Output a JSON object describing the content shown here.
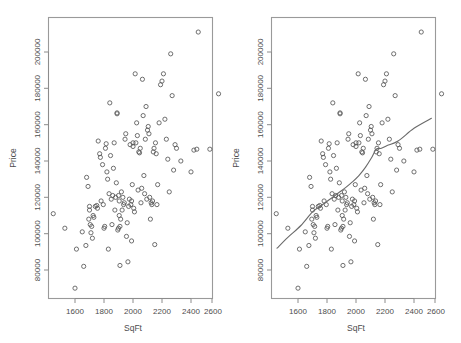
{
  "figure": {
    "title": "",
    "background_color": "#ffffff",
    "panel_count": 2,
    "point_color": "#565656",
    "line_color": "#6a6a6a",
    "frame_color": "#9a9a9a"
  },
  "panels": [
    {
      "name": "scatter-only",
      "has_fit_line": false,
      "xlabel": "SqFt",
      "ylabel": "Price"
    },
    {
      "name": "scatter-with-fit",
      "has_fit_line": true,
      "xlabel": "SqFt",
      "ylabel": "Price"
    }
  ],
  "chart_data": {
    "type": "scatter",
    "title": "",
    "subtitle": "",
    "xlabel": "SqFt",
    "ylabel": "Price",
    "xlim": [
      1440,
      2640
    ],
    "ylim": [
      66000,
      213000
    ],
    "xticks": [
      1600,
      1800,
      2000,
      2200,
      2400,
      2600
    ],
    "xtick_labels": [
      "1600",
      "1800",
      "2000",
      "2200",
      "2400",
      "2600"
    ],
    "yticks": [
      80000,
      100000,
      120000,
      140000,
      160000,
      180000,
      200000
    ],
    "ytick_labels": [
      "80000",
      "100000",
      "120000",
      "140000",
      "160000",
      "180000",
      "200000"
    ],
    "grid": false,
    "legend": null,
    "marker": "open-circle",
    "n_points": 128,
    "x": [
      1450,
      1530,
      1600,
      1610,
      1650,
      1660,
      1675,
      1680,
      1690,
      1695,
      1700,
      1700,
      1705,
      1710,
      1715,
      1720,
      1725,
      1730,
      1740,
      1750,
      1755,
      1760,
      1770,
      1775,
      1780,
      1790,
      1795,
      1800,
      1805,
      1810,
      1815,
      1820,
      1825,
      1830,
      1835,
      1840,
      1845,
      1850,
      1855,
      1860,
      1865,
      1870,
      1875,
      1880,
      1885,
      1890,
      1890,
      1895,
      1900,
      1900,
      1905,
      1905,
      1910,
      1910,
      1915,
      1920,
      1925,
      1930,
      1935,
      1940,
      1945,
      1950,
      1955,
      1960,
      1965,
      1970,
      1975,
      1980,
      1985,
      1990,
      1990,
      1995,
      2000,
      2000,
      2005,
      2010,
      2015,
      2020,
      2025,
      2030,
      2035,
      2040,
      2045,
      2050,
      2055,
      2060,
      2065,
      2070,
      2075,
      2080,
      2085,
      2090,
      2095,
      2100,
      2105,
      2110,
      2115,
      2120,
      2125,
      2130,
      2135,
      2140,
      2145,
      2150,
      2155,
      2160,
      2165,
      2170,
      2180,
      2190,
      2200,
      2210,
      2220,
      2230,
      2240,
      2250,
      2260,
      2270,
      2280,
      2290,
      2300,
      2330,
      2400,
      2420,
      2440,
      2450,
      2530,
      2590
    ],
    "y": [
      111000,
      103000,
      70000,
      91500,
      101000,
      82000,
      93500,
      131000,
      126000,
      108000,
      113000,
      115000,
      105000,
      100500,
      104000,
      97500,
      110000,
      109000,
      115000,
      115500,
      114000,
      151000,
      144000,
      142000,
      118000,
      138000,
      116000,
      103000,
      104000,
      147000,
      149500,
      134000,
      130000,
      91500,
      122000,
      172000,
      143000,
      119000,
      105000,
      121000,
      136000,
      150000,
      113000,
      120000,
      128000,
      166000,
      166500,
      102000,
      103000,
      121000,
      110000,
      118000,
      82500,
      104000,
      108000,
      123000,
      113000,
      120000,
      116000,
      117000,
      152000,
      155000,
      98500,
      106000,
      84500,
      115000,
      119000,
      149000,
      116000,
      96000,
      118000,
      127000,
      150000,
      148000,
      114000,
      112000,
      188000,
      150000,
      161000,
      154000,
      124000,
      145000,
      144500,
      147000,
      117000,
      125000,
      185000,
      165000,
      132000,
      122000,
      152000,
      170000,
      119000,
      157000,
      159000,
      155000,
      120000,
      108000,
      117000,
      116000,
      118000,
      145000,
      147000,
      94000,
      150000,
      144000,
      116000,
      127000,
      161000,
      182000,
      184000,
      188000,
      163000,
      152000,
      141000,
      123000,
      199000,
      176000,
      135000,
      149000,
      147000,
      140000,
      134000,
      146000,
      146500,
      211000,
      146500,
      177000
    ],
    "fit_line": {
      "type": "lowess",
      "x": [
        1455,
        1530,
        1620,
        1700,
        1760,
        1830,
        1880,
        1930,
        1975,
        2020,
        2065,
        2105,
        2140,
        2175,
        2215,
        2290,
        2400,
        2520
      ],
      "y": [
        92000,
        98000,
        104500,
        112000,
        115500,
        119500,
        122500,
        125500,
        128500,
        132000,
        136500,
        141500,
        146500,
        147000,
        148500,
        151000,
        158000,
        163500
      ]
    }
  }
}
